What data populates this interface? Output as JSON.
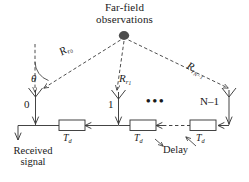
{
  "figure": {
    "domain": "technical-diagram",
    "stroke_color": "#3a3a3a",
    "source_dot_color": "#4d4d4d",
    "background_color": "#ffffff"
  },
  "title": {
    "line1": "Far-field",
    "line2": "observations"
  },
  "rays": [
    {
      "id": "ray-0",
      "label_main": "R",
      "label_sub": "r",
      "label_subsub": "0",
      "to_element": "0"
    },
    {
      "id": "ray-1",
      "label_main": "R",
      "label_sub": "r",
      "label_subsub": "1",
      "to_element": "1"
    },
    {
      "id": "ray-N-1",
      "label_main": "R",
      "label_sub": "r",
      "label_subsub": "N−1",
      "to_element": "N−1"
    }
  ],
  "angle": {
    "symbol": "θ",
    "description": "angle of arrival measured from array broadside normal"
  },
  "elements": [
    {
      "index": "0",
      "label": "0"
    },
    {
      "index": "1",
      "label": "1"
    },
    {
      "index": "N-1",
      "label": "N–1"
    }
  ],
  "ellipsis": "•••",
  "delay_blocks": [
    {
      "id": "delay-0",
      "label_main": "T",
      "label_sub": "d"
    },
    {
      "id": "delay-1",
      "label_main": "T",
      "label_sub": "d"
    },
    {
      "id": "delay-2",
      "label_main": "T",
      "label_sub": "d"
    }
  ],
  "annotations": {
    "delay_callout": "Delay"
  },
  "output": {
    "line1": "Received",
    "line2": "signal"
  }
}
